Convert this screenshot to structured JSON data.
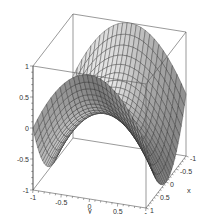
{
  "chart_data": {
    "type": "surface3d",
    "title": "",
    "function": "z = x^2 - y^2",
    "xlabel": "x",
    "ylabel": "y",
    "zlabel": "",
    "x_range": [
      -1,
      1
    ],
    "y_range": [
      -1,
      1
    ],
    "z_range": [
      -1,
      1
    ],
    "x_ticks": [
      "-1",
      "-0.5",
      "0",
      "0.5",
      "1"
    ],
    "y_ticks": [
      "-1",
      "-0.5",
      "0",
      "0.5",
      "1"
    ],
    "z_ticks": [
      "-1",
      "-0.5",
      "0",
      "0.5",
      "1"
    ],
    "grid_resolution": 25,
    "surface_color": "#c8c8c8",
    "mesh_color": "#222222",
    "box_color": "#555555",
    "grid": false,
    "legend": false
  }
}
